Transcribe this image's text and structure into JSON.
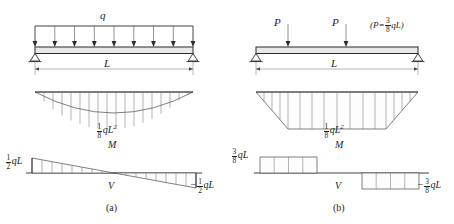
{
  "figure": {
    "type": "beam-shear-moment-diagram-set",
    "panels": [
      {
        "caption": "(a)",
        "load": {
          "kind": "uniformly-distributed",
          "symbol": "q"
        },
        "span_label": "L",
        "moment": {
          "axis_label": "M",
          "peak_label_num": "1",
          "peak_label_den": "8",
          "peak_label_sym": "qL",
          "peak_label_sup": "2",
          "shape": "parabola",
          "peak_value_text": "1/8 qL^2"
        },
        "shear": {
          "axis_label": "V",
          "left": {
            "num": "1",
            "den": "2",
            "sym": "qL",
            "sign": "",
            "value_text": "1/2 qL"
          },
          "right": {
            "num": "1",
            "den": "2",
            "sym": "qL",
            "sign": "−",
            "value_text": "-1/2 qL"
          },
          "shape": "linear-descending"
        }
      },
      {
        "caption": "(b)",
        "load": {
          "kind": "two-point-loads",
          "symbol": "P",
          "labels": [
            "P",
            "P"
          ],
          "note_open": "(",
          "note_sym": "P",
          "note_eq": "=",
          "note_num": "3",
          "note_den": "8",
          "note_tail": "qL",
          "note_close": ")",
          "note_text": "(P = 3/8 qL)"
        },
        "span_label": "L",
        "moment": {
          "axis_label": "M",
          "peak_label_num": "1",
          "peak_label_den": "8",
          "peak_label_sym": "qL",
          "peak_label_sup": "2",
          "shape": "trapezoid",
          "peak_value_text": "1/8 qL^2"
        },
        "shear": {
          "axis_label": "V",
          "left": {
            "num": "3",
            "den": "8",
            "sym": "qL",
            "sign": "",
            "value_text": "3/8 qL"
          },
          "right": {
            "num": "3",
            "den": "8",
            "sym": "qL",
            "sign": "−",
            "value_text": "-3/8 qL"
          },
          "shape": "step"
        }
      }
    ]
  },
  "colors": {
    "ink": "#2a2a2a",
    "hatch": "#6a6a6a",
    "beam_fill": "#e8e8e8",
    "page": "#ffffff"
  }
}
